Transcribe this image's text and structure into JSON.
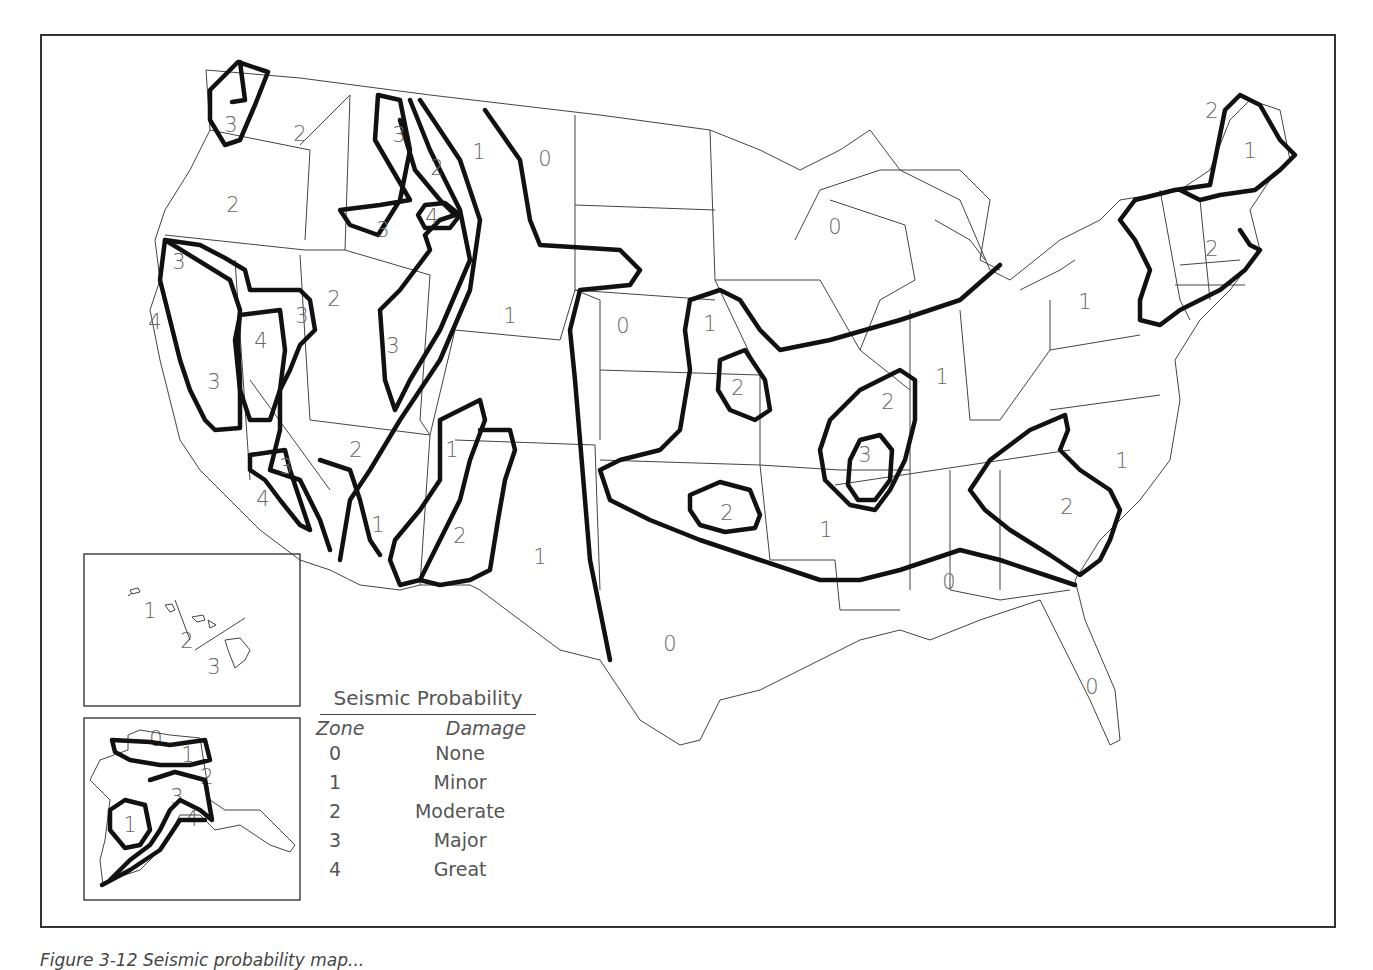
{
  "figure": {
    "caption": "Figure 3-12 Seismic probability map...",
    "caption_partially_visible": true
  },
  "legend": {
    "title": "Seismic Probability",
    "column_headers": {
      "zone": "Zone",
      "damage": "Damage"
    },
    "rows": [
      {
        "zone": "0",
        "damage": "None"
      },
      {
        "zone": "1",
        "damage": "Minor"
      },
      {
        "zone": "2",
        "damage": "Moderate"
      },
      {
        "zone": "3",
        "damage": "Major"
      },
      {
        "zone": "4",
        "damage": "Great"
      }
    ]
  },
  "map": {
    "region": "Contiguous United States",
    "contour_color": "#111111",
    "border_color": "#444444",
    "zone_labels": [
      {
        "label": "3",
        "x": 231,
        "y": 126
      },
      {
        "label": "2",
        "x": 300,
        "y": 135
      },
      {
        "label": "2",
        "x": 233,
        "y": 206
      },
      {
        "label": "3",
        "x": 399,
        "y": 136
      },
      {
        "label": "2",
        "x": 437,
        "y": 169
      },
      {
        "label": "1",
        "x": 479,
        "y": 153
      },
      {
        "label": "0",
        "x": 545,
        "y": 160
      },
      {
        "label": "3",
        "x": 383,
        "y": 231
      },
      {
        "label": "4",
        "x": 432,
        "y": 218
      },
      {
        "label": "3",
        "x": 179,
        "y": 263
      },
      {
        "label": "4",
        "x": 155,
        "y": 323
      },
      {
        "label": "2",
        "x": 334,
        "y": 300
      },
      {
        "label": "3",
        "x": 302,
        "y": 317
      },
      {
        "label": "4",
        "x": 261,
        "y": 342
      },
      {
        "label": "3",
        "x": 214,
        "y": 383
      },
      {
        "label": "3",
        "x": 393,
        "y": 347
      },
      {
        "label": "1",
        "x": 510,
        "y": 317
      },
      {
        "label": "0",
        "x": 623,
        "y": 327
      },
      {
        "label": "1",
        "x": 710,
        "y": 325
      },
      {
        "label": "2",
        "x": 738,
        "y": 389
      },
      {
        "label": "0",
        "x": 835,
        "y": 228
      },
      {
        "label": "1",
        "x": 1085,
        "y": 303
      },
      {
        "label": "1",
        "x": 942,
        "y": 378
      },
      {
        "label": "2",
        "x": 888,
        "y": 403
      },
      {
        "label": "3",
        "x": 865,
        "y": 456
      },
      {
        "label": "2",
        "x": 356,
        "y": 451
      },
      {
        "label": "1",
        "x": 452,
        "y": 451
      },
      {
        "label": "3",
        "x": 286,
        "y": 468
      },
      {
        "label": "4",
        "x": 263,
        "y": 500
      },
      {
        "label": "1",
        "x": 378,
        "y": 526
      },
      {
        "label": "2",
        "x": 460,
        "y": 537
      },
      {
        "label": "1",
        "x": 540,
        "y": 558
      },
      {
        "label": "2",
        "x": 727,
        "y": 514
      },
      {
        "label": "1",
        "x": 826,
        "y": 531
      },
      {
        "label": "0",
        "x": 670,
        "y": 645
      },
      {
        "label": "0",
        "x": 949,
        "y": 583
      },
      {
        "label": "0",
        "x": 1092,
        "y": 688
      },
      {
        "label": "1",
        "x": 1122,
        "y": 462
      },
      {
        "label": "2",
        "x": 1067,
        "y": 508
      },
      {
        "label": "2",
        "x": 1212,
        "y": 112
      },
      {
        "label": "1",
        "x": 1250,
        "y": 152
      },
      {
        "label": "2",
        "x": 1212,
        "y": 250
      }
    ]
  },
  "insets": {
    "hawaii": {
      "name": "Hawaii",
      "zone_labels": [
        {
          "label": "1",
          "x": 150,
          "y": 612
        },
        {
          "label": "2",
          "x": 187,
          "y": 642
        },
        {
          "label": "3",
          "x": 214,
          "y": 668
        }
      ]
    },
    "alaska": {
      "name": "Alaska",
      "zone_labels": [
        {
          "label": "0",
          "x": 156,
          "y": 740
        },
        {
          "label": "1",
          "x": 188,
          "y": 756
        },
        {
          "label": "2",
          "x": 207,
          "y": 778
        },
        {
          "label": "3",
          "x": 177,
          "y": 798
        },
        {
          "label": "1",
          "x": 130,
          "y": 826
        },
        {
          "label": "4",
          "x": 192,
          "y": 820
        }
      ]
    }
  }
}
